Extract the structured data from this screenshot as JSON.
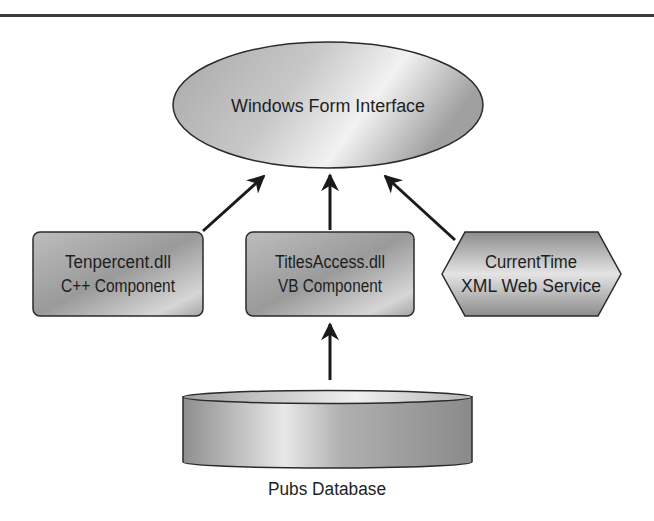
{
  "diagram": {
    "type": "architecture",
    "nodes": [
      {
        "id": "form",
        "shape": "ellipse",
        "lines": [
          "Windows Form Interface"
        ]
      },
      {
        "id": "tenpercent",
        "shape": "rounded-rect",
        "lines": [
          "Tenpercent.dll",
          "C++ Component"
        ]
      },
      {
        "id": "titlesaccess",
        "shape": "rounded-rect",
        "lines": [
          "TitlesAccess.dll",
          "VB Component"
        ]
      },
      {
        "id": "currenttime",
        "shape": "hexagon",
        "lines": [
          "CurrentTime",
          "XML Web Service"
        ]
      },
      {
        "id": "pubs",
        "shape": "cylinder",
        "lines": [
          "Pubs Database"
        ]
      }
    ],
    "edges": [
      {
        "from": "tenpercent",
        "to": "form"
      },
      {
        "from": "titlesaccess",
        "to": "form"
      },
      {
        "from": "currenttime",
        "to": "form"
      },
      {
        "from": "pubs",
        "to": "titlesaccess"
      }
    ],
    "colors": {
      "stroke": "#2a2a2a",
      "fill_dark": "#8e8e8e",
      "fill_light": "#e6e6e6",
      "text": "#1e1e1e"
    }
  }
}
